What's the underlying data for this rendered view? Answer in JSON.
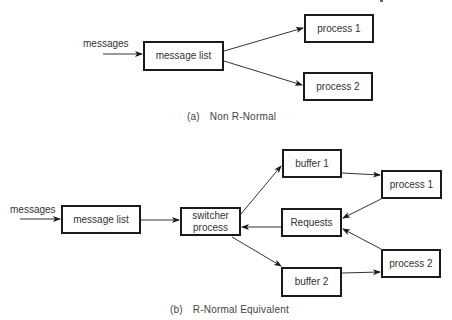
{
  "diagram_a": {
    "input_label": "messages",
    "nodes": {
      "message_list": "message list",
      "process_1": "process 1",
      "process_2": "process 2"
    },
    "caption_tag": "(a)",
    "caption_text": "Non R-Normal",
    "edges": [
      {
        "from": "messages",
        "to": "message_list"
      },
      {
        "from": "message_list",
        "to": "process_1"
      },
      {
        "from": "message_list",
        "to": "process_2"
      }
    ]
  },
  "diagram_b": {
    "input_label": "messages",
    "nodes": {
      "message_list": "message list",
      "switcher_process_line1": "switcher",
      "switcher_process_line2": "process",
      "buffer_1": "buffer 1",
      "buffer_2": "buffer 2",
      "requests": "Requests",
      "process_1": "process 1",
      "process_2": "process 2"
    },
    "caption_tag": "(b)",
    "caption_text": "R-Normal Equivalent",
    "edges": [
      {
        "from": "messages",
        "to": "message_list"
      },
      {
        "from": "message_list",
        "to": "switcher_process"
      },
      {
        "from": "switcher_process",
        "to": "buffer_1"
      },
      {
        "from": "switcher_process",
        "to": "buffer_2"
      },
      {
        "from": "requests",
        "to": "switcher_process"
      },
      {
        "from": "buffer_1",
        "to": "process_1"
      },
      {
        "from": "buffer_2",
        "to": "process_2"
      },
      {
        "from": "process_1",
        "to": "requests"
      },
      {
        "from": "process_2",
        "to": "requests"
      }
    ]
  }
}
